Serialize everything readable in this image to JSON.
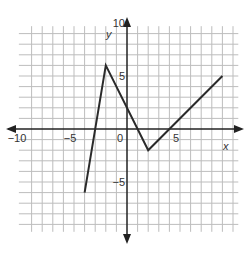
{
  "chart_data": {
    "type": "line",
    "title": "",
    "xlabel": "x",
    "ylabel": "y",
    "xlim": [
      -10,
      10
    ],
    "ylim": [
      -10,
      10
    ],
    "grid": true,
    "x_ticks": [
      {
        "value": -10,
        "label": "−10"
      },
      {
        "value": -5,
        "label": "−5"
      },
      {
        "value": 0,
        "label": "0"
      },
      {
        "value": 5,
        "label": "5"
      }
    ],
    "y_ticks": [
      {
        "value": 10,
        "label": "10"
      },
      {
        "value": 5,
        "label": "5"
      },
      {
        "value": -5,
        "label": "−5"
      }
    ],
    "series": [
      {
        "name": "piecewise function",
        "x": [
          -4,
          -2,
          2,
          9
        ],
        "y": [
          -6,
          6,
          -2,
          5
        ]
      }
    ]
  },
  "colors": {
    "grid": "#bdbdbd",
    "axis": "#222222",
    "line": "#2a2a2a"
  }
}
